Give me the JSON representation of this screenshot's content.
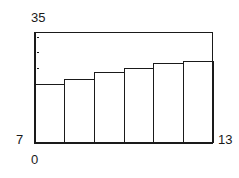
{
  "figure": {
    "background": "#ffffff",
    "line_color": "#1a1a1a",
    "frame": {
      "left": 34,
      "top": 32,
      "right": 213,
      "bottom": 143
    }
  },
  "axis_labels": {
    "y_max": "35",
    "y_min": "7",
    "x_min": "0",
    "x_max": "13"
  },
  "chart_data": {
    "type": "bar",
    "title": "",
    "xlabel": "",
    "ylabel": "",
    "categories": [
      "1",
      "2",
      "3",
      "4",
      "5",
      "6"
    ],
    "values": [
      22.0,
      23.2,
      24.9,
      25.9,
      27.1,
      27.7
    ],
    "bin_edges": [
      0,
      2.17,
      4.33,
      6.5,
      8.67,
      10.83,
      13
    ],
    "xlim": [
      0,
      13
    ],
    "ylim": [
      7,
      35
    ],
    "xticks": [
      0,
      13
    ],
    "xticklabels": [
      "0",
      "13"
    ],
    "yticks": [
      7,
      35
    ],
    "yticklabels": [
      "7",
      "35"
    ],
    "minor_yticks": [
      33.7,
      29.9,
      25.9
    ],
    "grid": false,
    "legend": null,
    "bar_fill": "none",
    "bar_edge_color": "#1a1a1a",
    "bar_gap": 0
  }
}
